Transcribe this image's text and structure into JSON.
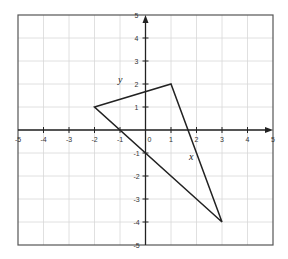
{
  "chart_data": {
    "type": "line",
    "title": "",
    "xlabel": "x",
    "ylabel": "y",
    "xlim": [
      -5,
      5
    ],
    "ylim": [
      -5,
      5
    ],
    "grid": true,
    "x_ticks": [
      -5,
      -4,
      -3,
      -2,
      -1,
      0,
      1,
      2,
      3,
      4,
      5
    ],
    "y_ticks": [
      -5,
      -4,
      -3,
      -2,
      -1,
      1,
      2,
      3,
      4,
      5
    ],
    "series": [
      {
        "name": "triangle",
        "closed": true,
        "points": [
          [
            -2,
            1
          ],
          [
            1,
            2
          ],
          [
            3,
            -4
          ]
        ]
      }
    ],
    "colors": {
      "grid": "#d8d8d8",
      "axis": "#222222",
      "frame": "#555555",
      "shape": "#222222"
    }
  }
}
